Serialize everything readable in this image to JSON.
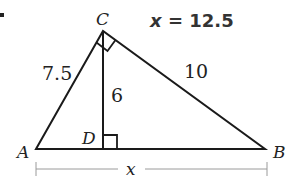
{
  "answer": {
    "variable": "x",
    "equals": " = ",
    "value": "12.5"
  },
  "vertices": {
    "A": "A",
    "B": "B",
    "C": "C",
    "D": "D"
  },
  "segments": {
    "AC": "7.5",
    "BC": "10",
    "CD": "6",
    "AB": "x"
  },
  "colors": {
    "line": "#1a1a1a",
    "dimension_line": "#9a9a9a",
    "text": "#222222"
  }
}
